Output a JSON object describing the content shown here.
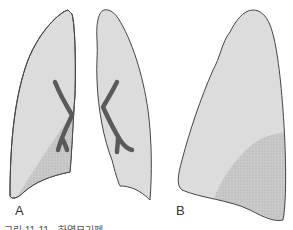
{
  "figure": {
    "panels": [
      {
        "label": "A",
        "description": "frontal view of both lungs with lower lobe shaded opacity in left-image lung and dark hilar vessels"
      },
      {
        "label": "B",
        "description": "lateral view of lung with shaded posterior-basal opacity"
      }
    ],
    "caption": "그림 11-11 · 하엽무기폐"
  },
  "colors": {
    "lung_fill": "#dcdcdc",
    "shaded_fill": "#c9c9c9",
    "outline": "#444444",
    "vessel": "#5a5a5a"
  }
}
